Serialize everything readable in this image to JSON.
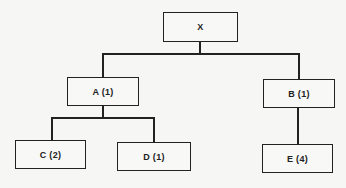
{
  "diagram": {
    "type": "tree",
    "nodes": [
      {
        "id": "X",
        "label": "X",
        "parent": null
      },
      {
        "id": "A",
        "label": "A (1)",
        "parent": "X"
      },
      {
        "id": "B",
        "label": "B (1)",
        "parent": "X"
      },
      {
        "id": "C",
        "label": "C (2)",
        "parent": "A"
      },
      {
        "id": "D",
        "label": "D (1)",
        "parent": "A"
      },
      {
        "id": "E",
        "label": "E (4)",
        "parent": "B"
      }
    ],
    "edges": [
      {
        "from": "X",
        "to": "A"
      },
      {
        "from": "X",
        "to": "B"
      },
      {
        "from": "A",
        "to": "C"
      },
      {
        "from": "A",
        "to": "D"
      },
      {
        "from": "B",
        "to": "E"
      }
    ],
    "colors": {
      "line": "#222222",
      "background": "#f6f6f4"
    }
  }
}
